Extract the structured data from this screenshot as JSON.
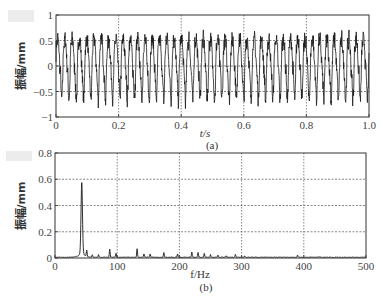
{
  "chart_data": [
    {
      "type": "line",
      "panel_label": "(a)",
      "title": "",
      "xlabel": "t/s",
      "ylabel": "振幅/mm",
      "xlim": [
        0,
        1.0
      ],
      "ylim": [
        -1,
        1
      ],
      "x_ticks": [
        "0",
        "0.2",
        "0.4",
        "0.6",
        "0.8",
        "1.0"
      ],
      "y_ticks": [
        "1",
        "0.5",
        "0",
        "-0.5",
        "-1"
      ],
      "grid": true,
      "grid_style": "dashed",
      "description": "Time-domain vibration signal, dominant oscillation ~43 Hz with amplitude roughly between -0.75 and 0.9 mm",
      "signal": {
        "dominant_freq_hz": 43,
        "amplitude_peak_max": 0.9,
        "amplitude_peak_min": -0.75,
        "duration_s": 1.0
      }
    },
    {
      "type": "line",
      "panel_label": "(b)",
      "title": "",
      "xlabel": "f/Hz",
      "ylabel": "振幅/mm",
      "xlim": [
        0,
        500
      ],
      "ylim": [
        0,
        0.8
      ],
      "x_ticks": [
        "0",
        "100",
        "200",
        "300",
        "400",
        "500"
      ],
      "y_ticks": [
        "0.8",
        "0.6",
        "0.4",
        "0.2",
        "0"
      ],
      "grid": true,
      "grid_style": "dashed",
      "description": "Amplitude spectrum with dominant peak near 43 Hz",
      "peaks": [
        {
          "f": 43,
          "amp": 0.51
        },
        {
          "f": 51,
          "amp": 0.05
        },
        {
          "f": 60,
          "amp": 0.02
        },
        {
          "f": 70,
          "amp": 0.02
        },
        {
          "f": 88,
          "amp": 0.06
        },
        {
          "f": 98,
          "amp": 0.03
        },
        {
          "f": 132,
          "amp": 0.065
        },
        {
          "f": 143,
          "amp": 0.025
        },
        {
          "f": 153,
          "amp": 0.025
        },
        {
          "f": 175,
          "amp": 0.035
        },
        {
          "f": 197,
          "amp": 0.025
        },
        {
          "f": 220,
          "amp": 0.04
        },
        {
          "f": 230,
          "amp": 0.035
        },
        {
          "f": 240,
          "amp": 0.03
        },
        {
          "f": 250,
          "amp": 0.02
        },
        {
          "f": 262,
          "amp": 0.015
        },
        {
          "f": 275,
          "amp": 0.012
        },
        {
          "f": 290,
          "amp": 0.02
        },
        {
          "f": 305,
          "amp": 0.008
        },
        {
          "f": 390,
          "amp": 0.015
        }
      ]
    }
  ],
  "labels": {
    "a": {
      "xlabel": "t/s",
      "ylabel": "振幅/mm",
      "caption": "(a)",
      "x_ticks": [
        "0",
        "0.2",
        "0.4",
        "0.6",
        "0.8",
        "1.0"
      ],
      "y_ticks": [
        "1",
        "0.5",
        "0",
        "-0.5",
        "-1"
      ]
    },
    "b": {
      "xlabel": "f/Hz",
      "ylabel": "振幅/mm",
      "caption": "(b)",
      "x_ticks": [
        "0",
        "100",
        "200",
        "300",
        "400",
        "500"
      ],
      "y_ticks": [
        "0.8",
        "0.6",
        "0.4",
        "0.2",
        "0"
      ]
    }
  },
  "colors": {
    "line": "#1a1a1a",
    "axes": "#333333",
    "grid": "#555555",
    "background": "#ffffff"
  }
}
